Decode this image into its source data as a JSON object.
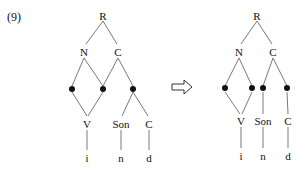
{
  "example_number": "(9)",
  "arrow_icon": "hollow-right-arrow",
  "left_tree": {
    "root": "R",
    "n": "N",
    "c": "C",
    "v": "V",
    "son": "Son",
    "coda": "C",
    "seg_i": "i",
    "seg_n": "n",
    "seg_d": "d"
  },
  "right_tree": {
    "root": "R",
    "n": "N",
    "c": "C",
    "v": "V",
    "son": "Son",
    "coda": "C",
    "seg_i": "i",
    "seg_n": "n",
    "seg_d": "d"
  }
}
